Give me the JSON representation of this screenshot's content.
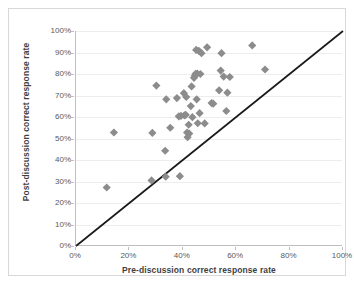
{
  "chart_data": {
    "type": "scatter",
    "title": "",
    "xlabel": "Pre-discussion correct response rate",
    "ylabel": "Post-discussion correct response rate",
    "xlim": [
      0,
      100
    ],
    "ylim": [
      0,
      100
    ],
    "xticks": [
      "0%",
      "20%",
      "40%",
      "60%",
      "80%",
      "100%"
    ],
    "xtick_values": [
      0,
      20,
      40,
      60,
      80,
      100
    ],
    "yticks": [
      "0%",
      "10%",
      "20%",
      "30%",
      "40%",
      "50%",
      "60%",
      "70%",
      "80%",
      "90%",
      "100%"
    ],
    "ytick_values": [
      0,
      10,
      20,
      30,
      40,
      50,
      60,
      70,
      80,
      90,
      100
    ],
    "grid": "horizontal",
    "legend": "none",
    "marker_shape": "diamond",
    "marker_color": "#8c8c8c",
    "marker_size": 5,
    "reference_line": {
      "name": "identity-line",
      "label": "y = x",
      "color": "#1a1a1a",
      "from": [
        0,
        0
      ],
      "to": [
        100,
        100
      ]
    },
    "series": [
      {
        "name": "discussion-pairs",
        "points": [
          [
            11.5,
            27.2
          ],
          [
            14.2,
            52.8
          ],
          [
            28.3,
            30.5
          ],
          [
            28.6,
            52.6
          ],
          [
            30.1,
            74.6
          ],
          [
            33.4,
            44.3
          ],
          [
            33.6,
            32.2
          ],
          [
            33.8,
            68.2
          ],
          [
            35.3,
            55.0
          ],
          [
            37.8,
            68.8
          ],
          [
            38.5,
            60.3
          ],
          [
            38.9,
            32.5
          ],
          [
            39.3,
            60.5
          ],
          [
            40.4,
            71.1
          ],
          [
            40.6,
            60.8
          ],
          [
            41.1,
            61.0
          ],
          [
            41.3,
            69.3
          ],
          [
            41.6,
            52.8
          ],
          [
            41.8,
            50.6
          ],
          [
            42.2,
            56.4
          ],
          [
            42.4,
            52.3
          ],
          [
            43.0,
            65.1
          ],
          [
            43.3,
            74.2
          ],
          [
            43.6,
            59.9
          ],
          [
            44.2,
            78.2
          ],
          [
            44.5,
            79.2
          ],
          [
            44.8,
            80.1
          ],
          [
            45.0,
            91.2
          ],
          [
            45.2,
            68.2
          ],
          [
            45.4,
            80.2
          ],
          [
            45.6,
            57.1
          ],
          [
            46.0,
            90.8
          ],
          [
            46.3,
            61.8
          ],
          [
            46.6,
            80.0
          ],
          [
            47.0,
            89.7
          ],
          [
            48.2,
            57.0
          ],
          [
            49.1,
            92.4
          ],
          [
            50.8,
            66.5
          ],
          [
            51.4,
            66.2
          ],
          [
            53.6,
            72.4
          ],
          [
            54.2,
            81.6
          ],
          [
            54.5,
            89.7
          ],
          [
            55.3,
            78.8
          ],
          [
            56.3,
            62.8
          ],
          [
            56.7,
            71.3
          ],
          [
            57.6,
            78.6
          ],
          [
            66.0,
            93.3
          ],
          [
            70.8,
            82.1
          ]
        ]
      }
    ]
  }
}
